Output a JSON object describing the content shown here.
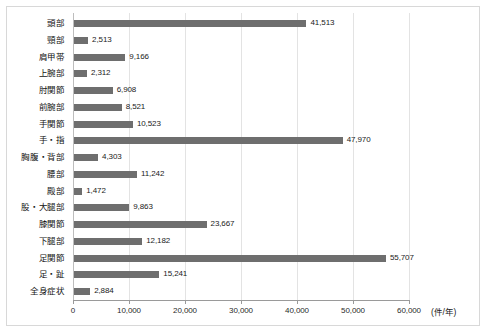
{
  "chart_data": {
    "type": "bar",
    "orientation": "horizontal",
    "title": "",
    "xlabel": "(件/年)",
    "ylabel": "",
    "xlim": [
      0,
      60000
    ],
    "xticks": [
      0,
      10000,
      20000,
      30000,
      40000,
      50000,
      60000
    ],
    "xtick_labels": [
      "0",
      "10,000",
      "20,000",
      "30,000",
      "40,000",
      "50,000",
      "60,000"
    ],
    "grid": true,
    "legend": null,
    "bar_color": "#6e6e6e",
    "gridline_color": "#e3e3e3",
    "axis_color": "#9a9a9a",
    "categories": [
      "頭部",
      "頸部",
      "肩甲帯",
      "上腕部",
      "肘関節",
      "前腕部",
      "手関節",
      "手・指",
      "胸腹・背部",
      "腰部",
      "殿部",
      "股・大腿部",
      "膝関節",
      "下腿部",
      "足関節",
      "足・趾",
      "全身症状"
    ],
    "values": [
      41513,
      2513,
      9166,
      2312,
      6908,
      8521,
      10523,
      47970,
      4303,
      11242,
      1472,
      9863,
      23667,
      12182,
      55707,
      15241,
      2884
    ],
    "value_labels": [
      "41,513",
      "2,513",
      "9,166",
      "2,312",
      "6,908",
      "8,521",
      "10,523",
      "47,970",
      "4,303",
      "11,242",
      "1,472",
      "9,863",
      "23,667",
      "12,182",
      "55,707",
      "15,241",
      "2,884"
    ]
  }
}
